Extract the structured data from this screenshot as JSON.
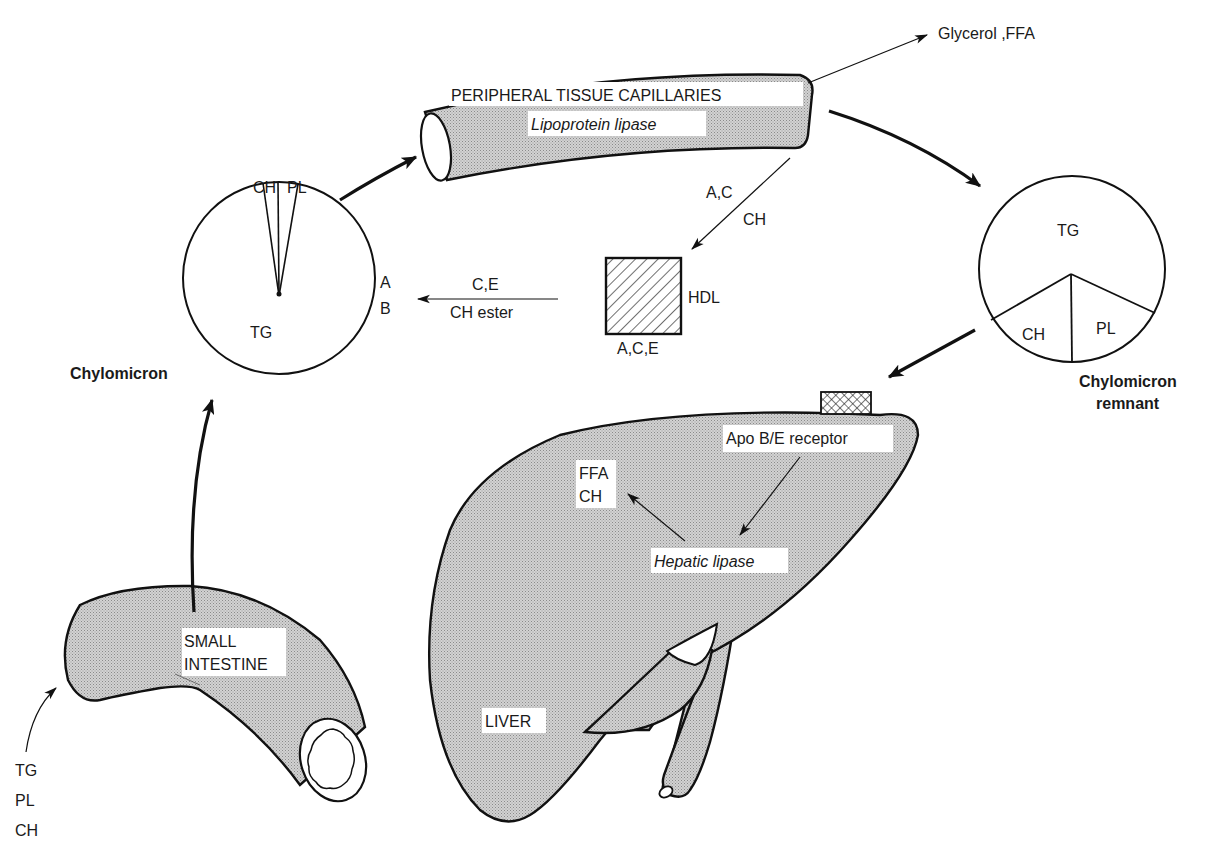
{
  "colors": {
    "ink": "#111111",
    "organ_fill": "#c9c9c9",
    "background": "#ffffff"
  },
  "capillaries": {
    "title": "PERIPHERAL TISSUE CAPILLARIES",
    "enzyme": "Lipoprotein lipase",
    "output": "Glycerol ,FFA"
  },
  "chylomicron": {
    "name": "Chylomicron",
    "components": [
      "CH",
      "PL",
      "TG"
    ],
    "apoproteins": [
      "A",
      "B"
    ]
  },
  "transfer_to_hdl": {
    "top": "A,C",
    "bottom": "CH"
  },
  "hdl": {
    "name": "HDL",
    "apoproteins": "A,C,E"
  },
  "transfer_from_hdl": {
    "top": "C,E",
    "bottom": "CH ester"
  },
  "remnant": {
    "name_line1": "Chylomicron",
    "name_line2": "remnant",
    "components": [
      "TG",
      "CH",
      "PL"
    ]
  },
  "liver": {
    "name": "LIVER",
    "receptor": "Apo B/E receptor",
    "enzyme": "Hepatic lipase",
    "products": [
      "FFA",
      "CH"
    ]
  },
  "intestine": {
    "name_line1": "SMALL",
    "name_line2": "INTESTINE",
    "inputs": [
      "TG",
      "PL",
      "CH"
    ]
  }
}
